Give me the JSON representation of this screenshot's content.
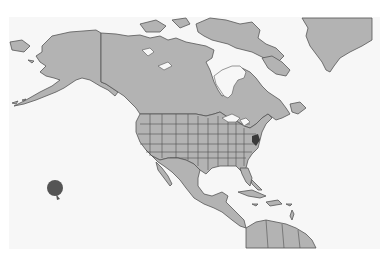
{
  "map": {
    "region": "North America",
    "projection": "equirectangular-like",
    "colors": {
      "background": "#ffffff",
      "ocean": "#f7f7f7",
      "land": "#b3b3b3",
      "border": "#555555",
      "marker": "#555555",
      "highlight": "#3a3a3a"
    },
    "features": [
      {
        "name": "Alaska",
        "type": "land"
      },
      {
        "name": "Canada",
        "type": "land"
      },
      {
        "name": "Greenland",
        "type": "land"
      },
      {
        "name": "Hudson Bay",
        "type": "water"
      },
      {
        "name": "Contiguous United States",
        "type": "land",
        "subdivisions": "states"
      },
      {
        "name": "Mexico",
        "type": "land"
      },
      {
        "name": "Central America",
        "type": "land"
      },
      {
        "name": "Caribbean",
        "type": "islands"
      },
      {
        "name": "Northern South America",
        "type": "land"
      }
    ],
    "markers": [
      {
        "name": "pacific-marker",
        "shape": "circle",
        "x": 55,
        "y": 188,
        "r": 8,
        "color": "#555555"
      }
    ],
    "highlighted_regions": [
      {
        "name": "mid-atlantic-highlight",
        "x": 256,
        "y": 142
      }
    ]
  }
}
